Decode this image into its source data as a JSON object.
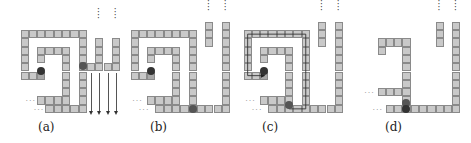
{
  "figure": {
    "cell_size": 8.3,
    "colors": {
      "cell_fill": "#c9c9c9",
      "cell_border": "#8a8a8a",
      "cell_dark": "#a8a8a8",
      "robot_dark": "#333333",
      "robot_mid": "#555555",
      "arrow": "#333333"
    },
    "panels": [
      {
        "id": "a",
        "label": "(a)",
        "origin": [
          20.5,
          30
        ],
        "label_pos": [
          38,
          120
        ],
        "cells": [
          [
            0,
            0
          ],
          [
            1,
            0
          ],
          [
            2,
            0
          ],
          [
            3,
            0
          ],
          [
            4,
            0
          ],
          [
            5,
            0
          ],
          [
            6,
            0
          ],
          [
            7,
            0
          ],
          [
            0,
            1
          ],
          [
            0,
            2
          ],
          [
            0,
            3
          ],
          [
            0,
            4
          ],
          [
            0,
            5
          ],
          [
            1,
            5
          ],
          [
            2,
            2
          ],
          [
            3,
            2
          ],
          [
            4,
            2
          ],
          [
            5,
            2
          ],
          [
            2,
            3
          ],
          [
            5,
            3
          ],
          [
            5,
            4
          ],
          [
            5,
            5
          ],
          [
            5,
            6
          ],
          [
            5,
            7
          ],
          [
            5,
            8
          ],
          [
            2,
            8
          ],
          [
            3,
            8
          ],
          [
            4,
            8
          ],
          [
            7,
            1
          ],
          [
            7,
            2
          ],
          [
            7,
            3
          ],
          [
            7,
            4
          ],
          [
            7,
            5
          ],
          [
            7,
            6
          ],
          [
            7,
            7
          ],
          [
            7,
            8
          ],
          [
            7,
            9
          ],
          [
            3,
            9
          ],
          [
            4,
            9
          ],
          [
            5,
            9
          ],
          [
            6,
            9
          ],
          [
            8,
            4
          ],
          [
            9,
            4
          ],
          [
            10,
            4
          ],
          [
            11,
            4
          ],
          [
            9,
            1
          ],
          [
            9,
            2
          ],
          [
            9,
            3
          ],
          [
            11,
            1
          ],
          [
            11,
            2
          ],
          [
            11,
            3
          ]
        ],
        "dark_cells": [
          [
            2,
            5
          ]
        ],
        "robots": [
          {
            "col": 2.0,
            "row": 4.4,
            "shade": "dark"
          },
          {
            "col": 7.0,
            "row": 3.9,
            "shade": "mid"
          }
        ],
        "vdots": [
          [
            9.1,
            -2.6
          ],
          [
            11.1,
            -2.6
          ]
        ],
        "hdots": [
          [
            0.6,
            8.1
          ],
          [
            1.6,
            9.1
          ]
        ],
        "arrows": [
          [
            8.5,
            5.2,
            9.9
          ],
          [
            9.5,
            5.2,
            9.9
          ],
          [
            10.5,
            5.2,
            9.9
          ],
          [
            11.5,
            5.2,
            9.9
          ]
        ]
      },
      {
        "id": "b",
        "label": "(b)",
        "origin": [
          130.5,
          30
        ],
        "label_pos": [
          150,
          120
        ],
        "cells": [
          [
            0,
            0
          ],
          [
            1,
            0
          ],
          [
            2,
            0
          ],
          [
            3,
            0
          ],
          [
            4,
            0
          ],
          [
            5,
            0
          ],
          [
            6,
            0
          ],
          [
            7,
            0
          ],
          [
            0,
            1
          ],
          [
            0,
            2
          ],
          [
            0,
            3
          ],
          [
            0,
            4
          ],
          [
            0,
            5
          ],
          [
            1,
            5
          ],
          [
            2,
            2
          ],
          [
            3,
            2
          ],
          [
            4,
            2
          ],
          [
            5,
            2
          ],
          [
            2,
            3
          ],
          [
            5,
            3
          ],
          [
            5,
            4
          ],
          [
            5,
            5
          ],
          [
            5,
            6
          ],
          [
            5,
            7
          ],
          [
            5,
            8
          ],
          [
            2,
            8
          ],
          [
            3,
            8
          ],
          [
            4,
            8
          ],
          [
            7,
            1
          ],
          [
            7,
            2
          ],
          [
            7,
            3
          ],
          [
            7,
            4
          ],
          [
            7,
            5
          ],
          [
            7,
            6
          ],
          [
            7,
            7
          ],
          [
            7,
            8
          ],
          [
            7,
            9
          ],
          [
            3,
            9
          ],
          [
            4,
            9
          ],
          [
            5,
            9
          ],
          [
            6,
            9
          ],
          [
            8,
            9
          ],
          [
            9,
            9
          ],
          [
            10,
            9
          ],
          [
            11,
            9
          ],
          [
            9,
            -1
          ],
          [
            9,
            0
          ],
          [
            9,
            1
          ],
          [
            11,
            -1
          ],
          [
            11,
            0
          ],
          [
            11,
            1
          ],
          [
            11,
            2
          ],
          [
            11,
            3
          ],
          [
            11,
            4
          ],
          [
            11,
            5
          ],
          [
            11,
            6
          ],
          [
            11,
            7
          ],
          [
            11,
            8
          ]
        ],
        "dark_cells": [
          [
            2,
            5
          ]
        ],
        "robots": [
          {
            "col": 2.0,
            "row": 4.4,
            "shade": "dark"
          },
          {
            "col": 7.0,
            "row": 9.0,
            "shade": "mid"
          }
        ],
        "vdots": [
          [
            9.1,
            -3.6
          ],
          [
            11.1,
            -3.6
          ]
        ],
        "hdots": [
          [
            0.2,
            8.1
          ],
          [
            1.0,
            9.1
          ]
        ],
        "arrows": []
      },
      {
        "id": "c",
        "label": "(c)",
        "origin": [
          243.5,
          30
        ],
        "label_pos": [
          262,
          120
        ],
        "cells": [
          [
            0,
            0
          ],
          [
            1,
            0
          ],
          [
            2,
            0
          ],
          [
            3,
            0
          ],
          [
            4,
            0
          ],
          [
            5,
            0
          ],
          [
            6,
            0
          ],
          [
            7,
            0
          ],
          [
            0,
            1
          ],
          [
            0,
            2
          ],
          [
            0,
            3
          ],
          [
            0,
            4
          ],
          [
            0,
            5
          ],
          [
            1,
            5
          ],
          [
            2,
            2
          ],
          [
            3,
            2
          ],
          [
            4,
            2
          ],
          [
            5,
            2
          ],
          [
            2,
            3
          ],
          [
            5,
            3
          ],
          [
            5,
            4
          ],
          [
            5,
            5
          ],
          [
            5,
            6
          ],
          [
            5,
            7
          ],
          [
            5,
            8
          ],
          [
            2,
            8
          ],
          [
            3,
            8
          ],
          [
            4,
            8
          ],
          [
            7,
            1
          ],
          [
            7,
            2
          ],
          [
            7,
            3
          ],
          [
            7,
            4
          ],
          [
            7,
            5
          ],
          [
            7,
            6
          ],
          [
            7,
            7
          ],
          [
            7,
            8
          ],
          [
            7,
            9
          ],
          [
            3,
            9
          ],
          [
            4,
            9
          ],
          [
            5,
            9
          ],
          [
            6,
            9
          ],
          [
            8,
            9
          ],
          [
            9,
            9
          ],
          [
            10,
            9
          ],
          [
            11,
            9
          ],
          [
            9,
            -1
          ],
          [
            9,
            0
          ],
          [
            9,
            1
          ],
          [
            11,
            -1
          ],
          [
            11,
            0
          ],
          [
            11,
            1
          ],
          [
            11,
            2
          ],
          [
            11,
            3
          ],
          [
            11,
            4
          ],
          [
            11,
            5
          ],
          [
            11,
            6
          ],
          [
            11,
            7
          ],
          [
            11,
            8
          ]
        ],
        "dark_cells": [
          [
            2,
            5
          ]
        ],
        "robots": [
          {
            "col": 2.0,
            "row": 4.4,
            "shade": "dark"
          },
          {
            "col": 5.0,
            "row": 8.6,
            "shade": "mid"
          }
        ],
        "vdots": [
          [
            9.1,
            -3.6
          ],
          [
            11.1,
            -3.6
          ]
        ],
        "hdots": [
          [
            0.2,
            8.1
          ],
          [
            1.0,
            9.1
          ]
        ],
        "path": [
          [
            5.5,
            8.9
          ],
          [
            5.5,
            9.5
          ],
          [
            7.5,
            9.5
          ],
          [
            7.5,
            0.5
          ],
          [
            0.5,
            0.5
          ],
          [
            0.5,
            5.5
          ],
          [
            2.5,
            5.5
          ]
        ],
        "arrows": []
      },
      {
        "id": "d",
        "label": "(d)",
        "origin": [
          377.5,
          30
        ],
        "label_pos": [
          383,
          120
        ],
        "cells": [
          [
            0,
            1
          ],
          [
            1,
            1
          ],
          [
            2,
            1
          ],
          [
            3,
            1
          ],
          [
            0,
            2
          ],
          [
            3,
            2
          ],
          [
            3,
            3
          ],
          [
            3,
            4
          ],
          [
            3,
            5
          ],
          [
            3,
            6
          ],
          [
            3,
            7
          ],
          [
            3,
            8
          ],
          [
            0,
            7
          ],
          [
            1,
            7
          ],
          [
            2,
            7
          ],
          [
            1,
            9
          ],
          [
            2,
            9
          ],
          [
            3,
            9
          ],
          [
            4,
            9
          ],
          [
            5,
            9
          ],
          [
            6,
            9
          ],
          [
            7,
            9
          ],
          [
            8,
            9
          ],
          [
            9,
            9
          ],
          [
            7,
            -1
          ],
          [
            7,
            0
          ],
          [
            7,
            1
          ],
          [
            9,
            -1
          ],
          [
            9,
            0
          ],
          [
            9,
            1
          ],
          [
            9,
            2
          ],
          [
            9,
            3
          ],
          [
            9,
            4
          ],
          [
            9,
            5
          ],
          [
            9,
            6
          ],
          [
            9,
            7
          ],
          [
            9,
            8
          ]
        ],
        "dark_cells": [],
        "robots": [
          {
            "col": 3.0,
            "row": 8.3,
            "shade": "mid"
          },
          {
            "col": 3.0,
            "row": 9.0,
            "shade": "dark"
          }
        ],
        "vdots": [
          [
            7.1,
            -3.6
          ],
          [
            9.1,
            -3.6
          ]
        ],
        "hdots": [
          [
            -1.6,
            7.1
          ],
          [
            -0.6,
            9.1
          ]
        ],
        "arrows": []
      }
    ]
  }
}
